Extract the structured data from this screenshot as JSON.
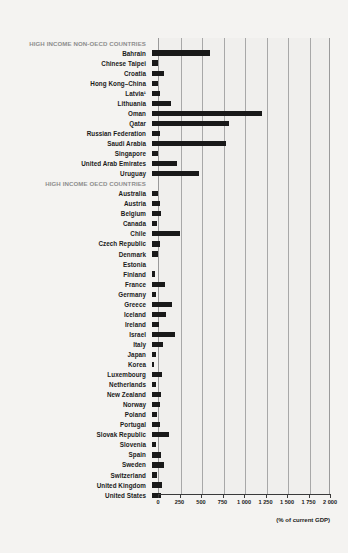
{
  "chart_data": {
    "type": "bar",
    "orientation": "horizontal",
    "title": "",
    "xlabel": "(% of current GDP)",
    "ylabel": "",
    "xlim": [
      0,
      2000
    ],
    "grid": true,
    "legend": "none",
    "tick_labels": [
      "0",
      "250",
      "500",
      "750",
      "1 000",
      "1 250",
      "1 500",
      "1 750",
      "2 000"
    ],
    "tick_values": [
      0,
      250,
      500,
      750,
      1000,
      1250,
      1500,
      1750,
      2000
    ],
    "bar_color": "#191919",
    "panel_color": "#f0efed",
    "group_label_color": "#8d8d8d",
    "groups": [
      {
        "name": "HIGH INCOME NON-OECD COUNTRIES",
        "categories": [
          "Bahrain",
          "Chinese Taipei",
          "Croatia",
          "Hong Kong–China",
          "Latvia¹",
          "Lithuania",
          "Oman",
          "Qatar",
          "Russian Federation",
          "Saudi Arabia",
          "Singapore",
          "United Arab Emirates",
          "Uruguay"
        ],
        "values": [
          677,
          69,
          138,
          65,
          96,
          219,
          1280,
          900,
          96,
          860,
          73,
          292,
          542
        ]
      },
      {
        "name": "HIGH INCOME OECD COUNTRIES",
        "categories": [
          "Australia",
          "Austria",
          "Belgium",
          "Canada",
          "Chile",
          "Czech Republic",
          "Denmark",
          "Estonia",
          "Finland",
          "France",
          "Germany",
          "Greece",
          "Iceland",
          "Ireland",
          "Israel",
          "Italy",
          "Japan",
          "Korea",
          "Luxembourg",
          "Netherlands",
          "New Zealand",
          "Norway",
          "Poland",
          "Portugal",
          "Slovak Republic",
          "Slovenia",
          "Spain",
          "Sweden",
          "Switzerland",
          "United Kingdom",
          "United States"
        ],
        "values": [
          69,
          92,
          100,
          54,
          323,
          88,
          69,
          0,
          35,
          146,
          50,
          234,
          158,
          81,
          265,
          131,
          50,
          23,
          119,
          42,
          100,
          92,
          54,
          88,
          192,
          50,
          104,
          138,
          58,
          115,
          104
        ]
      }
    ]
  }
}
